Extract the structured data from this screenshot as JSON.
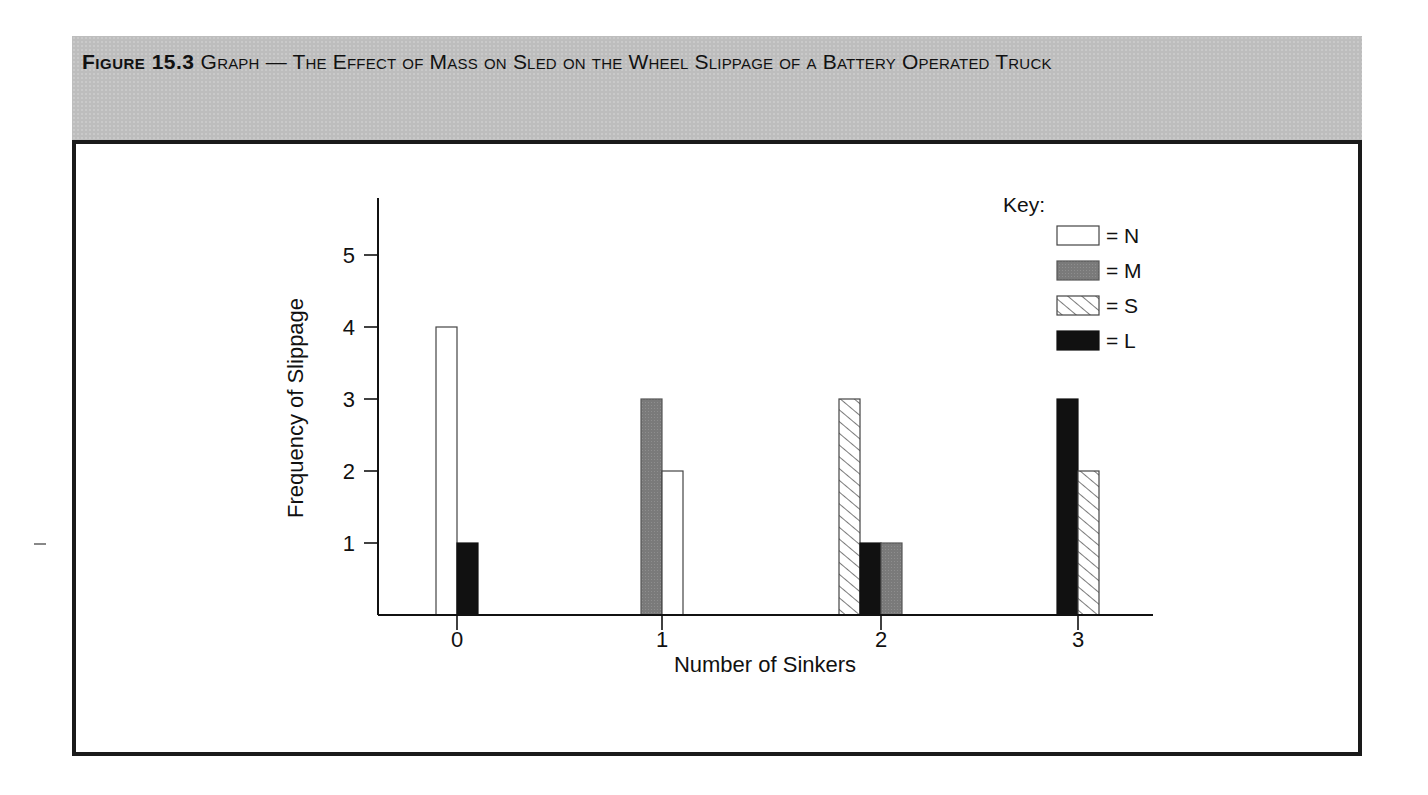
{
  "figure": {
    "label": "Figure 15.3",
    "title": "Graph — The Effect of Mass on Sled on the Wheel Slippage of a Battery Operated Truck"
  },
  "legend": {
    "title": "Key:",
    "items": [
      {
        "label": "= N",
        "series": "N",
        "pattern": "white"
      },
      {
        "label": "= M",
        "series": "M",
        "pattern": "gray"
      },
      {
        "label": "= S",
        "series": "S",
        "pattern": "hatched"
      },
      {
        "label": "= L",
        "series": "L",
        "pattern": "black"
      }
    ]
  },
  "colors": {
    "N": "#ffffff",
    "M": "#7a7a7a",
    "S": "hatch",
    "L": "#111111",
    "header_bg": "#bdbdbd",
    "frame": "#1a1a1a"
  },
  "chart_data": {
    "type": "bar",
    "title": "The Effect of Mass on Sled on the Wheel Slippage of a Battery Operated Truck",
    "xlabel": "Number of Sinkers",
    "ylabel": "Frequency of Slippage",
    "categories": [
      "0",
      "1",
      "2",
      "3"
    ],
    "yticks": [
      1,
      2,
      3,
      4,
      5
    ],
    "ylim": [
      0,
      5.7
    ],
    "grid": false,
    "legend_position": "top-right",
    "series": [
      {
        "name": "N",
        "values": [
          4,
          2,
          0,
          0
        ]
      },
      {
        "name": "M",
        "values": [
          0,
          3,
          1,
          0
        ]
      },
      {
        "name": "S",
        "values": [
          0,
          0,
          3,
          2
        ]
      },
      {
        "name": "L",
        "values": [
          1,
          0,
          1,
          3
        ]
      }
    ],
    "bars_drawn": [
      {
        "category": "0",
        "series": "N",
        "value": 4,
        "x0": 436
      },
      {
        "category": "0",
        "series": "L",
        "value": 1,
        "x0": 457
      },
      {
        "category": "1",
        "series": "M",
        "value": 3,
        "x0": 641
      },
      {
        "category": "1",
        "series": "N",
        "value": 2,
        "x0": 662
      },
      {
        "category": "2",
        "series": "S",
        "value": 3,
        "x0": 839
      },
      {
        "category": "2",
        "series": "L",
        "value": 1,
        "x0": 860
      },
      {
        "category": "2",
        "series": "M",
        "value": 1,
        "x0": 881
      },
      {
        "category": "3",
        "series": "L",
        "value": 3,
        "x0": 1057
      },
      {
        "category": "3",
        "series": "S",
        "value": 2,
        "x0": 1078
      }
    ]
  }
}
